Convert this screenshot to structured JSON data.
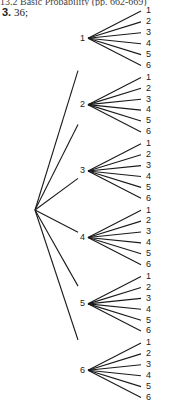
{
  "header": {
    "text": "13.2 Basic Probability (pp. 662-669)"
  },
  "answer": {
    "number": "3.",
    "value": "36;"
  },
  "diagram": {
    "type": "tree",
    "root": "",
    "first_level": [
      "1",
      "2",
      "3",
      "4",
      "5",
      "6"
    ],
    "second_level": [
      "1",
      "2",
      "3",
      "4",
      "5",
      "6"
    ],
    "total_outcomes": 36
  }
}
